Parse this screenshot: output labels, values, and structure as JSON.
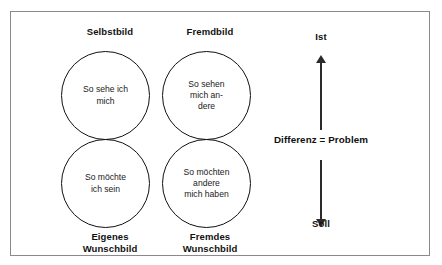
{
  "diagram": {
    "title_visible": false,
    "frame": {
      "border_color": "#8a8a8a",
      "background": "#ffffff"
    },
    "quadrant_labels": {
      "top_left": "Selbstbild",
      "top_right": "Fremdbild",
      "bottom_left": "Eigenes\nWunschbild",
      "bottom_right": "Fremdes\nWunschbild"
    },
    "circles": [
      {
        "id": "selbstbild",
        "text": "So sehe ich\nmich"
      },
      {
        "id": "fremdbild",
        "text": "So sehen\nmich an-\ndere"
      },
      {
        "id": "eigenes-wunschbild",
        "text": "So möchte\nich sein"
      },
      {
        "id": "fremdes-wunschbild",
        "text": "So möchten\nandere\nmich haben"
      }
    ],
    "axis": {
      "top_label": "Ist",
      "bottom_label": "Soll",
      "center_label": "Differenz = Problem",
      "line_color": "#2b2b2b"
    },
    "colors": {
      "text": "#111111",
      "circle_stroke": "#111111",
      "frame_stroke": "#8a8a8a"
    }
  }
}
